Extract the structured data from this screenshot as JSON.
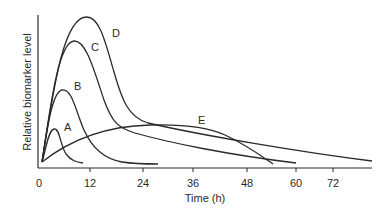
{
  "chart_data": {
    "type": "line",
    "title": "",
    "xlabel": "Time (h)",
    "ylabel": "Relative biomarker level",
    "xlim": [
      0,
      84
    ],
    "ylim": [
      0,
      1
    ],
    "grid": false,
    "legend": "inline curve labels",
    "x_ticks": [
      {
        "label": "0",
        "px": 39
      },
      {
        "label": "12",
        "px": 90
      },
      {
        "label": "24",
        "px": 143
      },
      {
        "label": "36",
        "px": 193
      },
      {
        "label": "48",
        "px": 247
      },
      {
        "label": "60",
        "px": 296
      },
      {
        "label": "72",
        "px": 333
      }
    ],
    "series": [
      {
        "name": "A",
        "peak_time_h": 3,
        "peak_rel_level": 0.22,
        "end_time_h": 10,
        "label_pos": [
          64,
          131
        ],
        "path": "M42,162 C46,150 48,130 54,129 C60,128 60,145 66,154 C71,161 77,162 83,163"
      },
      {
        "name": "B",
        "peak_time_h": 6,
        "peak_rel_level": 0.49,
        "end_time_h": 28,
        "label_pos": [
          74,
          90
        ],
        "path": "M42,162 C47,130 52,92 62,90 C72,88 76,112 84,130 C92,148 105,159 122,162 C135,164 148,164 158,164"
      },
      {
        "name": "C",
        "peak_time_h": 8,
        "peak_rel_level": 0.8,
        "end_time_h": 60,
        "label_pos": [
          91,
          51
        ],
        "path": "M42,162 C50,110 58,42 74,41 C86,40 94,70 104,100 C112,122 118,128 135,133 C170,143 230,155 296,163"
      },
      {
        "name": "D",
        "peak_time_h": 11,
        "peak_rel_level": 0.98,
        "end_time_h": 80,
        "label_pos": [
          112,
          37
        ],
        "path": "M42,162 C52,100 62,18 86,17 C100,16 106,45 114,72 C122,100 128,117 148,123 C200,135 300,152 372,161"
      },
      {
        "name": "E",
        "peak_time_h": 24,
        "peak_rel_level": 0.31,
        "end_time_h": 54,
        "label_pos": [
          198,
          124
        ],
        "path": "M42,162 C70,140 105,126 150,125 C185,124 210,128 225,135 C245,144 260,155 273,164"
      }
    ],
    "colors": {
      "line": "#2a2a2a",
      "background": "#ffffff"
    }
  }
}
